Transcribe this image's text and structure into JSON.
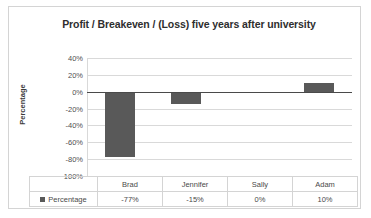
{
  "chart_data": {
    "type": "bar",
    "title": "Profit / Breakeven / (Loss) five years after university",
    "xlabel": "",
    "ylabel": "Percentage",
    "categories": [
      "Brad",
      "Jennifer",
      "Sally",
      "Adam"
    ],
    "values": [
      -77,
      -15,
      0,
      10
    ],
    "value_labels": [
      "-77%",
      "-15%",
      "0%",
      "10%"
    ],
    "series": [
      {
        "name": "Percentage",
        "values": [
          -77,
          -15,
          0,
          10
        ],
        "color": "#595959"
      }
    ],
    "ylim": [
      -100,
      40
    ],
    "ytick_values": [
      40,
      20,
      0,
      -20,
      -40,
      -60,
      -80,
      -100
    ],
    "ytick_labels": [
      "40%",
      "20%",
      "0%",
      "-20%",
      "-40%",
      "-60%",
      "-80%",
      "100%"
    ],
    "grid": true,
    "legend_position": "bottom-left",
    "zero_line": true,
    "has_data_table": true
  },
  "legend": {
    "series_label": "Percentage"
  },
  "colors": {
    "bar": "#595959",
    "gridline": "#d9d9d9",
    "zero_axis": "#4a4a4a",
    "frame_border": "#d4d4d4",
    "text": "#4a4a4a",
    "title_text": "#2e2e2e"
  }
}
